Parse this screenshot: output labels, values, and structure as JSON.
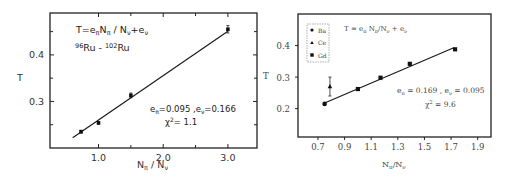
{
  "chart_data": [
    {
      "type": "scatter",
      "title": "",
      "annotations": {
        "formula": "T=eπNπ/Nν+eν",
        "formula_parts": {
          "T": "T=e",
          "sub1": "π",
          "mid": "N",
          "sub2": "π",
          "slash": " / N",
          "sub3": "ν",
          "plus": "+e",
          "sub4": "ν"
        },
        "reaction": {
          "mass1": "96",
          "el1": "Ru",
          "sep": " - ",
          "mass2": "102",
          "el2": "Ru"
        },
        "fit_params": {
          "e_pi_label": "e",
          "e_pi_sub": "π",
          "e_pi_value": "=0.095",
          "sep": " ,",
          "e_nu_label": "e",
          "e_nu_sub": "ν",
          "e_nu_value": "=0.166"
        },
        "chi2": {
          "symbol": "χ",
          "sup": "2",
          "value": "= 1.1"
        }
      },
      "xlabel": "Nπ / Nν",
      "xlabel_parts": {
        "n1": "N",
        "s1": "π",
        "slash": " / N",
        "s2": "ν"
      },
      "ylabel": "T",
      "xlim": [
        0.25,
        3.45
      ],
      "ylim": [
        0.2,
        0.49
      ],
      "x_ticks": [
        1.0,
        2.0,
        3.0
      ],
      "x_tick_labels": [
        "1.0",
        "2.0",
        "3.0"
      ],
      "x_minor_ticks": [
        1.5,
        2.5
      ],
      "y_ticks": [
        0.3,
        0.4
      ],
      "y_tick_labels": [
        "0.3",
        "0.4"
      ],
      "y_minor_ticks": [
        0.25,
        0.35,
        0.45
      ],
      "grid": false,
      "series": [
        {
          "name": "data",
          "marker": "square",
          "x": [
            0.73,
            1.0,
            1.5,
            3.0
          ],
          "y": [
            0.235,
            0.254,
            0.313,
            0.455
          ],
          "yerr": [
            0.003,
            0.003,
            0.005,
            0.008
          ]
        }
      ],
      "fit_line": {
        "x": [
          0.6,
          3.0
        ],
        "y": [
          0.222,
          0.451
        ]
      }
    },
    {
      "type": "scatter",
      "title": "",
      "annotations": {
        "formula": "T = eπ Nπ/Nν + eν",
        "formula_parts": {
          "T": "T = e",
          "sub1": "π",
          "mid": " N",
          "sub2": "π",
          "slash": "/N",
          "sub3": "ν",
          "plus": " + e",
          "sub4": "ν"
        },
        "fit_params": {
          "e_pi_label": "e",
          "e_pi_sub": "π",
          "e_pi_value": " = 0.169",
          "sep": " , ",
          "e_nu_label": "e",
          "e_nu_sub": "ν",
          "e_nu_value": " = 0.095"
        },
        "chi2": {
          "symbol": "χ",
          "sup": "2",
          "value": " = 9.6"
        }
      },
      "legend": {
        "placement": "top-left",
        "entries": [
          {
            "label": "Ba",
            "marker": "circle"
          },
          {
            "label": "Ce",
            "marker": "triangle"
          },
          {
            "label": "Gd",
            "marker": "square"
          }
        ]
      },
      "xlabel": "Nπ/Nν",
      "xlabel_parts": {
        "n1": "N",
        "s1": "π",
        "slash": "/N",
        "s2": "ν"
      },
      "ylabel": "T",
      "xlim": [
        0.55,
        2.0
      ],
      "ylim": [
        0.11,
        0.5
      ],
      "x_ticks": [
        0.7,
        0.9,
        1.1,
        1.3,
        1.5,
        1.7,
        1.9
      ],
      "x_tick_labels": [
        "0.7",
        "0.9",
        "1.1",
        "1.3",
        "1.5",
        "1.7",
        "1.9"
      ],
      "y_ticks": [
        0.2,
        0.3,
        0.4
      ],
      "y_tick_labels": [
        "0.2",
        "0.3",
        "0.4"
      ],
      "grid": false,
      "series": [
        {
          "name": "Ba",
          "marker": "circle",
          "x": [
            0.75
          ],
          "y": [
            0.215
          ],
          "yerr": [
            0.004
          ]
        },
        {
          "name": "Ce",
          "marker": "triangle",
          "x": [
            0.79
          ],
          "y": [
            0.27
          ],
          "yerr": [
            0.03
          ]
        },
        {
          "name": "Gd",
          "marker": "square",
          "x": [
            1.0,
            1.17,
            1.39,
            1.73
          ],
          "y": [
            0.262,
            0.298,
            0.342,
            0.388
          ],
          "yerr": [
            0.003,
            0.003,
            0.003,
            0.003
          ]
        }
      ],
      "fit_line": {
        "x": [
          0.75,
          1.72
        ],
        "y": [
          0.218,
          0.393
        ]
      }
    }
  ]
}
